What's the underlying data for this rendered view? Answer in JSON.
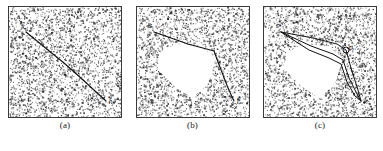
{
  "figure": {
    "caption_a": "(a)",
    "caption_b": "(b)",
    "caption_c": "(c)",
    "label_start": "s",
    "label_finish": "f",
    "label_obstacle_point": "o",
    "colors": {
      "background": "#ffffff",
      "noise": "#2b2b2b",
      "path": "#111111",
      "border": "#3a3a3a",
      "obstacle_fill": "#ffffff"
    }
  },
  "chart_data": [
    {
      "type": "line",
      "title": "(a)",
      "xlabel": "",
      "ylabel": "",
      "xlim": [
        0,
        114
      ],
      "ylim": [
        0,
        112
      ],
      "grid": false,
      "legend_position": "none",
      "background": "uniform random noise field",
      "annotations": [
        {
          "text": "s",
          "x": 13,
          "y": 22
        },
        {
          "text": "f",
          "x": 101,
          "y": 96
        }
      ],
      "series": [
        {
          "name": "direct-path",
          "points": [
            [
              18,
              26
            ],
            [
              40,
              44
            ],
            [
              56,
              57
            ],
            [
              74,
              73
            ],
            [
              98,
              95
            ]
          ]
        }
      ],
      "obstacles": []
    },
    {
      "type": "line",
      "title": "(b)",
      "xlabel": "",
      "ylabel": "",
      "xlim": [
        0,
        114
      ],
      "ylim": [
        0,
        112
      ],
      "grid": false,
      "legend_position": "none",
      "background": "uniform random noise field with polygonal void",
      "annotations": [
        {
          "text": "s",
          "x": 13,
          "y": 22
        },
        {
          "text": "f",
          "x": 101,
          "y": 96
        }
      ],
      "series": [
        {
          "name": "obstacle-avoiding-path",
          "points": [
            [
              18,
              26
            ],
            [
              52,
              38
            ],
            [
              78,
              45
            ],
            [
              82,
              56
            ],
            [
              92,
              82
            ],
            [
              98,
              95
            ]
          ]
        }
      ],
      "obstacles": [
        {
          "name": "white-polygon-void",
          "vertices": [
            [
              23,
              47
            ],
            [
              40,
              38
            ],
            [
              64,
              40
            ],
            [
              80,
              52
            ],
            [
              72,
              78
            ],
            [
              56,
              92
            ],
            [
              38,
              80
            ],
            [
              22,
              64
            ]
          ]
        }
      ]
    },
    {
      "type": "line",
      "title": "(c)",
      "xlabel": "",
      "ylabel": "",
      "xlim": [
        0,
        114
      ],
      "ylim": [
        0,
        112
      ],
      "grid": false,
      "legend_position": "none",
      "background": "uniform random noise field with polygonal void",
      "annotations": [
        {
          "text": "s",
          "x": 13,
          "y": 22
        },
        {
          "text": "f",
          "x": 101,
          "y": 96
        },
        {
          "text": "o",
          "x": 86,
          "y": 44
        }
      ],
      "series": [
        {
          "name": "candidate-path-upper",
          "points": [
            [
              18,
              26
            ],
            [
              50,
              32
            ],
            [
              74,
              38
            ],
            [
              83,
              44
            ],
            [
              88,
              62
            ],
            [
              95,
              84
            ],
            [
              98,
              95
            ]
          ]
        },
        {
          "name": "candidate-path-middle",
          "points": [
            [
              18,
              26
            ],
            [
              48,
              40
            ],
            [
              70,
              48
            ],
            [
              80,
              54
            ],
            [
              86,
              72
            ],
            [
              94,
              88
            ],
            [
              98,
              95
            ]
          ]
        },
        {
          "name": "candidate-path-lower",
          "points": [
            [
              18,
              26
            ],
            [
              46,
              44
            ],
            [
              66,
              52
            ],
            [
              78,
              58
            ],
            [
              84,
              76
            ],
            [
              92,
              90
            ],
            [
              98,
              95
            ]
          ]
        }
      ],
      "waypoint_markers": [
        {
          "name": "o",
          "x": 83,
          "y": 44,
          "r": 3
        }
      ],
      "obstacles": [
        {
          "name": "white-polygon-void",
          "vertices": [
            [
              23,
              47
            ],
            [
              40,
              38
            ],
            [
              64,
              40
            ],
            [
              80,
              52
            ],
            [
              72,
              78
            ],
            [
              56,
              92
            ],
            [
              38,
              80
            ],
            [
              22,
              64
            ]
          ]
        }
      ]
    }
  ]
}
